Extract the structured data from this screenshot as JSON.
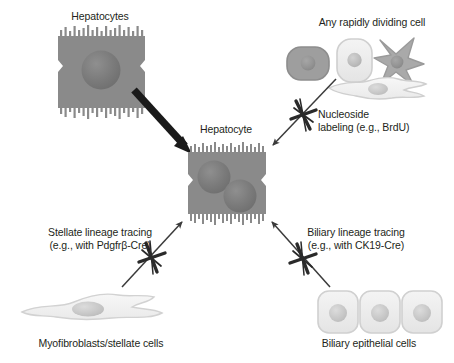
{
  "figure": {
    "background_color": "#ffffff",
    "width": 454,
    "height": 363
  },
  "labels": {
    "source_hepatocytes": "Hepatocytes",
    "dividing_cell": "Any rapidly dividing cell",
    "center_hepatocyte": "Hepatocyte",
    "nucleoside_labeling": "Nucleoside\nlabeling (e.g., BrdU)",
    "stellate_tracing": "Stellate lineage tracing\n(e.g., with Pdgfrβ-Cre)",
    "biliary_tracing": "Biliary lineage tracing\n(e.g., with CK19-Cre)",
    "myofibroblasts": "Myofibroblasts/stellate cells",
    "biliary_epithelial": "Biliary epithelial cells"
  },
  "arrows": [
    {
      "name": "hepatocyte-to-hepatocyte",
      "from": "Hepatocytes",
      "to": "Hepatocyte",
      "style": "thick-solid",
      "blocked": false,
      "color": "#1a1a1a"
    },
    {
      "name": "dividing-cell-to-hepatocyte",
      "from": "Any rapidly dividing cell",
      "to": "Hepatocyte",
      "style": "thin-solid",
      "blocked": true,
      "block_label": "Nucleoside labeling (e.g., BrdU)",
      "color": "#3b3b3b"
    },
    {
      "name": "myofibroblast-to-hepatocyte",
      "from": "Myofibroblasts/stellate cells",
      "to": "Hepatocyte",
      "style": "thin-solid",
      "blocked": true,
      "block_label": "Stellate lineage tracing (e.g., with Pdgfrβ-Cre)",
      "color": "#3b3b3b"
    },
    {
      "name": "biliary-to-hepatocyte",
      "from": "Biliary epithelial cells",
      "to": "Hepatocyte",
      "style": "thin-solid",
      "blocked": true,
      "block_label": "Biliary lineage tracing (e.g., with CK19-Cre)",
      "color": "#3b3b3b"
    }
  ],
  "cells": {
    "source_hepatocyte": {
      "shape": "square-with-microvilli",
      "nuclei": 1,
      "body_color": "#8a8a8a",
      "nucleus_color": "#787878"
    },
    "center_hepatocyte": {
      "shape": "square-with-microvilli",
      "nuclei": 2,
      "body_color": "#8a8a8a",
      "nucleus_color": "#787878"
    },
    "dividing_cells": [
      {
        "name": "rounded-dark-cell",
        "shape": "rounded-rect",
        "body_color": "#9d9d9d",
        "nucleus_color": "#8a8a8a"
      },
      {
        "name": "rounded-light-cell",
        "shape": "rounded-rect",
        "body_color": "#e8e8e8",
        "nucleus_color": "#b8b8b8"
      },
      {
        "name": "stellate-shaped-cell",
        "shape": "star",
        "body_color": "#a8a8a8",
        "nucleus_color": "#8f8f8f"
      },
      {
        "name": "spindle-shaped-cell",
        "shape": "spindle",
        "body_color": "#dcdcdc",
        "nucleus_color": "#a9a9a9"
      }
    ],
    "myofibroblast": {
      "shape": "spindle-wide",
      "body_color": "#ededed",
      "nucleus_color": "#c0c0c0",
      "count": 1
    },
    "biliary_epithelial": {
      "shape": "rounded-rect",
      "body_color": "#f0f0f0",
      "nucleus_color": "#c4c4c4",
      "count": 3
    }
  },
  "colors": {
    "text": "#231f20",
    "arrow_thick": "#1a1a1a",
    "arrow_thin": "#3b3b3b",
    "block_mark": "#2a2a2a"
  }
}
